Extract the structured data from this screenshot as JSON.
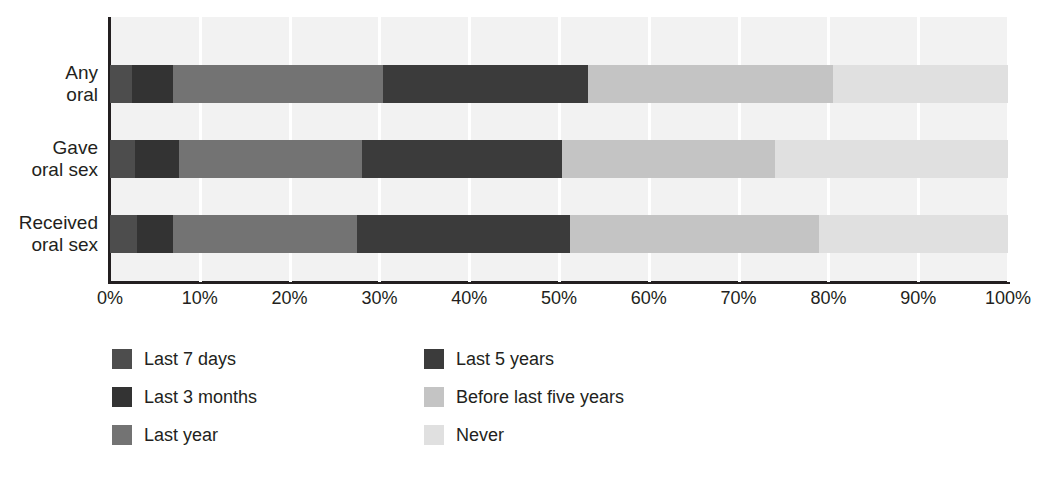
{
  "chart_data": {
    "type": "bar",
    "orientation": "horizontal",
    "stacked": true,
    "stack_mode": "percent",
    "title": "",
    "subtitle": "",
    "xlabel": "",
    "ylabel": "",
    "xlim": [
      0,
      100
    ],
    "grid": true,
    "grid_axis": "x",
    "legend_position": "bottom-left",
    "categories": [
      "Any oral",
      "Gave oral sex",
      "Received oral sex"
    ],
    "category_lines": [
      [
        "Any",
        "oral"
      ],
      [
        "Gave",
        "oral sex"
      ],
      [
        "Received",
        "oral sex"
      ]
    ],
    "xticks": [
      "0%",
      "10%",
      "20%",
      "30%",
      "40%",
      "50%",
      "60%",
      "70%",
      "80%",
      "90%",
      "100%"
    ],
    "xtick_values": [
      0,
      10,
      20,
      30,
      40,
      50,
      60,
      70,
      80,
      90,
      100
    ],
    "series": [
      {
        "name": "Last 7 days",
        "color": "#4d4d4d",
        "values": [
          2.5,
          2.8,
          3.0
        ]
      },
      {
        "name": "Last 3 months",
        "color": "#333333",
        "values": [
          4.5,
          4.9,
          4.0
        ]
      },
      {
        "name": "Last year",
        "color": "#737373",
        "values": [
          23.4,
          20.4,
          20.5
        ]
      },
      {
        "name": "Last 5 years",
        "color": "#3b3b3b",
        "values": [
          22.8,
          22.2,
          23.7
        ]
      },
      {
        "name": "Before last five years",
        "color": "#c4c4c4",
        "values": [
          27.3,
          23.8,
          27.8
        ]
      },
      {
        "name": "Never",
        "color": "#e0e0e0",
        "values": [
          19.5,
          25.9,
          21.0
        ]
      }
    ],
    "cumulative_boundaries": {
      "Any oral": [
        2.5,
        7.0,
        30.4,
        53.2,
        80.5,
        100
      ],
      "Gave oral sex": [
        2.8,
        7.7,
        28.1,
        50.3,
        74.1,
        100
      ],
      "Received oral sex": [
        3.0,
        7.0,
        27.5,
        51.2,
        79.0,
        100
      ]
    },
    "plot_background": "#f2f2f2",
    "gridline_color": "#ffffff",
    "axis_color": "#231f20"
  }
}
